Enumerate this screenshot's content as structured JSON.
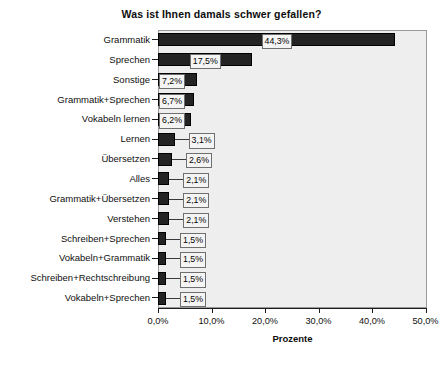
{
  "chart_data": {
    "type": "bar",
    "orientation": "horizontal",
    "title": "Was ist Ihnen damals schwer gefallen?",
    "xlabel": "Prozente",
    "ylabel": "",
    "xlim": [
      0,
      55
    ],
    "grid": false,
    "legend": null,
    "xticks": [
      "0,0%",
      "10,0%",
      "20,0%",
      "30,0%",
      "40,0%",
      "50,0%"
    ],
    "xtick_values": [
      0,
      10,
      20,
      30,
      40,
      50
    ],
    "categories": [
      "Grammatik",
      "Sprechen",
      "Sonstige",
      "Grammatik+Sprechen",
      "Vokabeln lernen",
      "Lernen",
      "Übersetzen",
      "Alles",
      "Grammatik+Übersetzen",
      "Verstehen",
      "Schreiben+Sprechen",
      "Vokabeln+Grammatik",
      "Schreiben+Rechtschreibung",
      "Vokabeln+Sprechen"
    ],
    "values": [
      44.3,
      17.5,
      7.2,
      6.7,
      6.2,
      3.1,
      2.6,
      2.1,
      2.1,
      2.1,
      1.5,
      1.5,
      1.5,
      1.5
    ],
    "value_labels": [
      "44,3%",
      "17,5%",
      "7,2%",
      "6,7%",
      "6,2%",
      "3,1%",
      "2,6%",
      "2,1%",
      "2,1%",
      "2,1%",
      "1,5%",
      "1,5%",
      "1,5%",
      "1,5%"
    ],
    "colors": {
      "bar": "#232323",
      "bar_border": "#000000",
      "plot_background": "#eeeeee",
      "plot_border": "#9a9a9a",
      "label_background": "#f4f4f4",
      "label_border": "#6f6f6f",
      "text": "#0f0f0f"
    }
  }
}
